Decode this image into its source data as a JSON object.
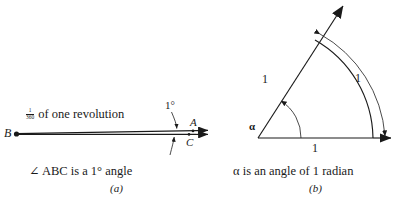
{
  "figure": {
    "ink_color": "#1a1a1a",
    "background_color": "#ffffff"
  },
  "panel_a": {
    "tag": "(a)",
    "caption": "∠ ABC is a 1° angle",
    "revolution_label": {
      "numerator": "1",
      "denominator": "360",
      "text": " of one revolution"
    },
    "angle_label": "1°",
    "vertex_label": "B",
    "ray_point_upper_label": "A",
    "ray_point_lower_label": "C",
    "angle_degrees": 1,
    "description": "A vertex B at the left with two rays that diverge by one degree, appearing as an extremely thin wedge; point A lies on the upper ray and point C on the lower ray near the right end. A curved arrow from the label 1 degree points down into the gap and a second arrow points up into the gap from below."
  },
  "panel_b": {
    "tag": "(b)",
    "caption": "α is an angle of 1 radian",
    "angle_symbol": "α",
    "radius_slant_label": "1",
    "radius_base_label": "1",
    "arc_label": "1",
    "angle_radians": 1,
    "angle_degrees_equivalent": 57.3,
    "description": "A central angle alpha at the origin between a horizontal ray pointing right and a slanted ray pointing up and to the right. Both radii are labeled 1 and the intercepted arc is labeled 1, with a curved double headed arrow spanning the arc."
  }
}
